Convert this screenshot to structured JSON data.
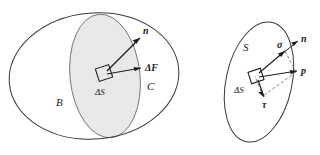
{
  "figure": {
    "background_color": "#ffffff",
    "line_color": "#3b3a3a",
    "shade_color": "#e9e9e9",
    "width": 320,
    "height": 155
  },
  "left_diagram": {
    "name": "body-cut-diagram",
    "labels": {
      "body_b": "B",
      "body_c": "C",
      "area_element": "ΔS",
      "normal_vector": "n",
      "force_vector": "ΔF"
    }
  },
  "right_diagram": {
    "name": "traction-decomposition-diagram",
    "labels": {
      "surface": "S",
      "area_element": "ΔS",
      "normal_vector": "n",
      "traction_vector": "p",
      "normal_stress": "σ",
      "shear_stress": "τ"
    }
  }
}
